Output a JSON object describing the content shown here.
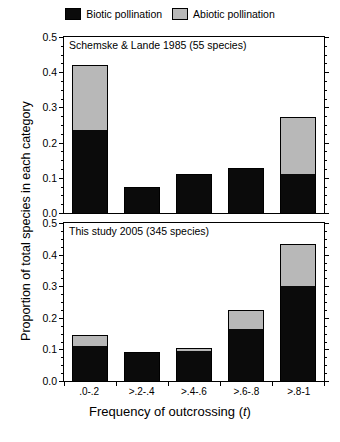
{
  "legend": {
    "items": [
      {
        "label": "Biotic pollination",
        "color": "#0b0b0b",
        "icon": "black-square-swatch"
      },
      {
        "label": "Abiotic pollination",
        "color": "#b8b8b8",
        "icon": "gray-square-swatch"
      }
    ]
  },
  "axes": {
    "ylabel": "Proportion of total species in each category",
    "xlabel_prefix": "Frequency of outcrossing (",
    "xlabel_italic": "t",
    "xlabel_suffix": ")",
    "yticks": [
      "0.0",
      "0.1",
      "0.2",
      "0.3",
      "0.4",
      "0.5"
    ],
    "categories": [
      ".0-.2",
      ">.2-.4",
      ">.4-.6",
      ">.6-.8",
      ">.8-1"
    ]
  },
  "panels": [
    {
      "title": "Schemske & Lande 1985 (55 species)"
    },
    {
      "title": "This study 2005 (345 species)"
    }
  ],
  "chart_data": [
    {
      "type": "bar",
      "title": "Schemske & Lande 1985 (55 species)",
      "stacked": true,
      "categories": [
        ".0-.2",
        ">.2-.4",
        ">.4-.6",
        ">.6-.8",
        ">.8-1"
      ],
      "series": [
        {
          "name": "Biotic pollination",
          "color": "#0b0b0b",
          "values": [
            0.235,
            0.073,
            0.11,
            0.128,
            0.11
          ]
        },
        {
          "name": "Abiotic pollination",
          "color": "#b8b8b8",
          "values": [
            0.185,
            0.0,
            0.0,
            0.0,
            0.163
          ]
        }
      ],
      "totals": [
        0.42,
        0.073,
        0.11,
        0.128,
        0.273
      ],
      "xlabel": "Frequency of outcrossing (t)",
      "ylabel": "Proportion of total species in each category",
      "ylim": [
        0.0,
        0.5
      ],
      "ytick_step": 0.1,
      "minor_ticks": true,
      "grid": false,
      "legend_position": "top-center",
      "n_species": 55
    },
    {
      "type": "bar",
      "title": "This study 2005 (345 species)",
      "stacked": true,
      "categories": [
        ".0-.2",
        ">.2-.4",
        ">.4-.6",
        ">.6-.8",
        ">.8-1"
      ],
      "series": [
        {
          "name": "Biotic pollination",
          "color": "#0b0b0b",
          "values": [
            0.11,
            0.088,
            0.095,
            0.165,
            0.3
          ]
        },
        {
          "name": "Abiotic pollination",
          "color": "#b8b8b8",
          "values": [
            0.035,
            0.002,
            0.01,
            0.06,
            0.135
          ]
        }
      ],
      "totals": [
        0.145,
        0.09,
        0.105,
        0.225,
        0.435
      ],
      "xlabel": "Frequency of outcrossing (t)",
      "ylabel": "Proportion of total species in each category",
      "ylim": [
        0.0,
        0.5
      ],
      "ytick_step": 0.1,
      "minor_ticks": true,
      "grid": false,
      "legend_position": "top-center",
      "n_species": 345
    }
  ]
}
